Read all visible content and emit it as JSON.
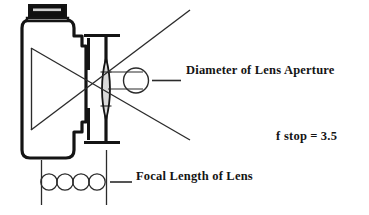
{
  "diagram": {
    "labels": {
      "aperture": "Diameter of Lens Aperture",
      "focal_length": "Focal Length of Lens",
      "fstop_symbol": "f stop",
      "fstop_equals": "=",
      "fstop_value": "3.5"
    },
    "camera_top_marking": "J TIGHT",
    "colors": {
      "ink": "#141414",
      "line": "#2b2b2b",
      "lens_fill": "#d9d9d9",
      "camera_body_fill": "#ffffff",
      "top_plate_fill": "#101010",
      "background": "#ffffff"
    },
    "parts": [
      {
        "name": "camera-body",
        "description": "rounded rectangular camera body with thick black outline"
      },
      {
        "name": "camera-top-plate",
        "description": "dark top plate with light marking"
      },
      {
        "name": "lens-barrel",
        "description": "lens barrel extending to the right of the body"
      },
      {
        "name": "lens-element",
        "description": "biconvex lens element, gray filled"
      },
      {
        "name": "aperture-circle",
        "description": "circle indicating lens aperture diameter"
      },
      {
        "name": "ray-lines",
        "description": "crossing light rays forming an X through the lens"
      },
      {
        "name": "focal-length-circles",
        "description": "four tangent circles spanning the focal length"
      },
      {
        "name": "focal-length-extension-lines",
        "description": "two vertical extension lines bounding the focal length"
      }
    ]
  }
}
